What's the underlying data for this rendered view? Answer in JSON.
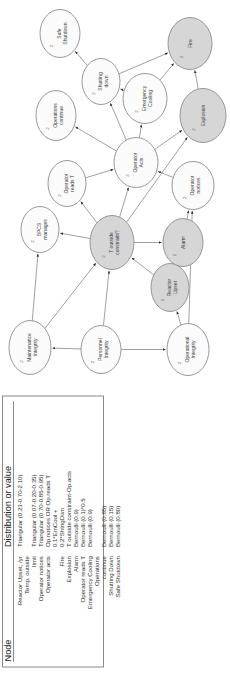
{
  "table": {
    "headers": {
      "node": "Node",
      "dist": "Distribution or value"
    },
    "rows": [
      {
        "node": "Reactor Upset, /yr",
        "dist": "Triangular (0.23-0.70-2.10)"
      },
      {
        "node": "Temp. outside",
        "dist": ""
      },
      {
        "node": "limit",
        "dist": "Triangular (0.07-0.20-0.35)"
      },
      {
        "node": "Operator notices",
        "dist": "Triangular (0.70-0.85-0.95)"
      },
      {
        "node": "Operator acts",
        "dist": "Op.notices  OR  Op.reads T"
      },
      {
        "node": "",
        "dist": "0.1*EmCool +"
      },
      {
        "node": "Fire",
        "dist": "0.2*ShtngDwn"
      },
      {
        "node": "Explosion",
        "dist": "T outside constraint-Op.acts"
      },
      {
        "node": "Alarm",
        "dist": "Bernoulli (0.9)"
      },
      {
        "node": "Operator reads T",
        "dist": "Bernoulli (0.1)*0.5"
      },
      {
        "node": "Emergency Cooling",
        "dist": "Bernoulli (0.9)"
      },
      {
        "node": "Operations",
        "dist": ""
      },
      {
        "node": "continue",
        "dist": "Bernoulli (0.85)"
      },
      {
        "node": "Shutting Down",
        "dist": "Bernoulli (0.15)"
      },
      {
        "node": "Safe Shutdown",
        "dist": "Bernoulli (0.80)"
      }
    ]
  },
  "diagram": {
    "title": "",
    "nodes": [
      {
        "id": "operational_integrity",
        "label_line1": "Operational",
        "label_line2": "Integrity",
        "num": "2",
        "shaded": false,
        "x": 34,
        "y": 188,
        "rx": 26,
        "ry": 21
      },
      {
        "id": "personnel_integrity",
        "label_line1": "Personnel",
        "label_line2": "Integrity",
        "num": "2",
        "shaded": false,
        "x": 34,
        "y": 101,
        "rx": 24,
        "ry": 20
      },
      {
        "id": "maintenance_integrity",
        "label_line1": "Maintenance",
        "label_line2": "Integrity",
        "num": "2",
        "shaded": false,
        "x": 36,
        "y": 30,
        "rx": 27,
        "ry": 21
      },
      {
        "id": "reactor_upset",
        "label_line1": "Reactor",
        "label_line2": "Upset",
        "num": "2",
        "shaded": true,
        "x": 96,
        "y": 170,
        "rx": 24,
        "ry": 19
      },
      {
        "id": "alarm",
        "label_line1": "Alarm",
        "label_line2": "",
        "num": "2",
        "shaded": true,
        "x": 141,
        "y": 183,
        "rx": 24,
        "ry": 20
      },
      {
        "id": "t_outside_constraint",
        "label_line1": "T outside",
        "label_line2": "constraint?",
        "num": "2",
        "shaded": true,
        "x": 141,
        "y": 112,
        "rx": 27,
        "ry": 22
      },
      {
        "id": "bpcs_manages",
        "label_line1": "BPCS",
        "label_line2": "manages",
        "num": "2",
        "shaded": false,
        "x": 154,
        "y": 40,
        "rx": 23,
        "ry": 19
      },
      {
        "id": "operator_reads_t",
        "label_line1": "Operator",
        "label_line2": "reads T",
        "num": "2",
        "shaded": false,
        "x": 200,
        "y": 67,
        "rx": 23,
        "ry": 19
      },
      {
        "id": "operator_notices",
        "label_line1": "Operator",
        "label_line2": "notices",
        "num": "2",
        "shaded": false,
        "x": 198,
        "y": 193,
        "rx": 24,
        "ry": 21
      },
      {
        "id": "operator_acts",
        "label_line1": "Operator",
        "label_line2": "Acts",
        "num": "2",
        "shaded": false,
        "x": 221,
        "y": 136,
        "rx": 25,
        "ry": 22
      },
      {
        "id": "operations_continue",
        "label_line1": "Operations",
        "label_line2": "continue",
        "num": "2",
        "shaded": false,
        "x": 268,
        "y": 56,
        "rx": 25,
        "ry": 20
      },
      {
        "id": "emergency_cooling",
        "label_line1": "Emergency",
        "label_line2": "Cooling",
        "num": "2",
        "shaded": false,
        "x": 285,
        "y": 145,
        "rx": 25,
        "ry": 22
      },
      {
        "id": "shutting_down",
        "label_line1": "Shutting",
        "label_line2": "down",
        "num": "2",
        "shaded": false,
        "x": 302,
        "y": 101,
        "rx": 23,
        "ry": 19
      },
      {
        "id": "explosion",
        "label_line1": "Explosion",
        "label_line2": "",
        "num": "2",
        "shaded": true,
        "x": 268,
        "y": 203,
        "rx": 27,
        "ry": 23
      },
      {
        "id": "fire",
        "label_line1": "Fire",
        "label_line2": "",
        "num": "2",
        "shaded": true,
        "x": 340,
        "y": 190,
        "rx": 26,
        "ry": 22
      },
      {
        "id": "safe_shutdown",
        "label_line1": "Safe",
        "label_line2": "Shutdown",
        "num": "2",
        "shaded": false,
        "x": 350,
        "y": 60,
        "rx": 24,
        "ry": 20
      }
    ],
    "edges": [
      [
        "operational_integrity",
        "reactor_upset"
      ],
      [
        "operational_integrity",
        "operator_notices"
      ],
      [
        "personnel_integrity",
        "operational_integrity"
      ],
      [
        "personnel_integrity",
        "t_outside_constraint"
      ],
      [
        "personnel_integrity",
        "maintenance_integrity"
      ],
      [
        "maintenance_integrity",
        "t_outside_constraint"
      ],
      [
        "maintenance_integrity",
        "bpcs_manages"
      ],
      [
        "reactor_upset",
        "t_outside_constraint"
      ],
      [
        "reactor_upset",
        "alarm"
      ],
      [
        "t_outside_constraint",
        "alarm"
      ],
      [
        "t_outside_constraint",
        "bpcs_manages"
      ],
      [
        "t_outside_constraint",
        "operator_reads_t"
      ],
      [
        "t_outside_constraint",
        "operator_acts"
      ],
      [
        "t_outside_constraint",
        "explosion"
      ],
      [
        "alarm",
        "operator_notices"
      ],
      [
        "operator_notices",
        "operator_acts"
      ],
      [
        "operator_reads_t",
        "operator_acts"
      ],
      [
        "operator_acts",
        "explosion"
      ],
      [
        "operator_acts",
        "emergency_cooling"
      ],
      [
        "operator_acts",
        "operations_continue"
      ],
      [
        "operator_acts",
        "shutting_down"
      ],
      [
        "emergency_cooling",
        "fire"
      ],
      [
        "emergency_cooling",
        "shutting_down"
      ],
      [
        "shutting_down",
        "fire"
      ],
      [
        "shutting_down",
        "safe_shutdown"
      ],
      [
        "explosion",
        "fire"
      ]
    ],
    "colors": {
      "node_fill_plain": "#fbfbfb",
      "node_fill_shaded": "#d6d6d6",
      "node_stroke": "#8c8c8c",
      "edge": "#6e6e6e",
      "label": "#404040"
    }
  }
}
